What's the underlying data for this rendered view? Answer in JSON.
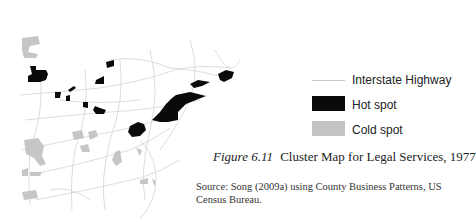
{
  "figure": {
    "label": "Figure 6.11",
    "title": "Cluster Map for Legal Services, 1977",
    "source_line": "Source: Song (2009a) using County Business Patterns, US Census Bureau."
  },
  "legend": {
    "items": [
      {
        "label": "Interstate Highway",
        "type": "line",
        "color": "#c8c8c8"
      },
      {
        "label": "Hot spot",
        "type": "box",
        "color": "#0a0a0a"
      },
      {
        "label": "Cold spot",
        "type": "box",
        "color": "#c4c4c4"
      }
    ]
  },
  "map": {
    "region": "Northeastern / Midwestern United States",
    "colors": {
      "hot": "#0a0a0a",
      "cold": "#c4c4c4",
      "highway": "#d6d6d6"
    }
  }
}
